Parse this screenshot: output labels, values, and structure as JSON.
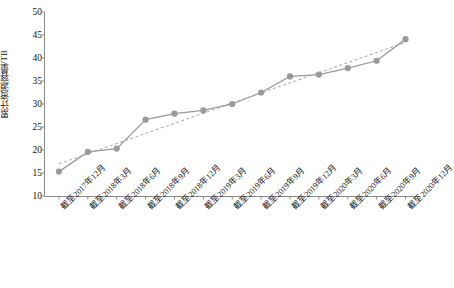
{
  "chart_data": {
    "type": "line",
    "title": "",
    "subtitle": "",
    "xlabel": "",
    "ylabel": "累计资源容量/TB",
    "ylim": [
      10,
      50
    ],
    "ytick_step": 5,
    "ytick_labels": [
      "50",
      "45",
      "40",
      "35",
      "30",
      "25",
      "20",
      "15",
      "10"
    ],
    "ytick_values": [
      50,
      45,
      40,
      35,
      30,
      25,
      20,
      15,
      10
    ],
    "grid": false,
    "legend": "none",
    "categories": [
      "截至2017年12月",
      "截至2018年3月",
      "截至2018年6月",
      "截至2018年9月",
      "截至2018年12月",
      "截至2019年3月",
      "截至2019年6月",
      "截至2019年9月",
      "截至2019年12月",
      "截至2020年3月",
      "截至2020年6月",
      "截至2020年9月",
      "截至2020年12月"
    ],
    "series": [
      {
        "name": "累计资源容量",
        "style": "solid-with-markers",
        "color": "#9a9a9a",
        "marker": "circle",
        "values": [
          15.3,
          19.6,
          20.3,
          26.6,
          27.9,
          28.6,
          30.0,
          32.5,
          36.0,
          36.4,
          37.8,
          39.4,
          44.1
        ]
      },
      {
        "name": "趋势线",
        "style": "dashed",
        "color": "#b0b0b0",
        "marker": "none",
        "values": [
          17.0,
          19.2,
          21.4,
          23.6,
          25.8,
          28.0,
          30.2,
          32.4,
          34.6,
          36.8,
          39.0,
          41.2,
          43.4
        ]
      }
    ]
  },
  "colors": {
    "line": "#9a9a9a",
    "trend": "#b5b5b5",
    "marker": "#9a9a9a",
    "axis": "#8a8a8a",
    "text": "#1a1a1a"
  }
}
